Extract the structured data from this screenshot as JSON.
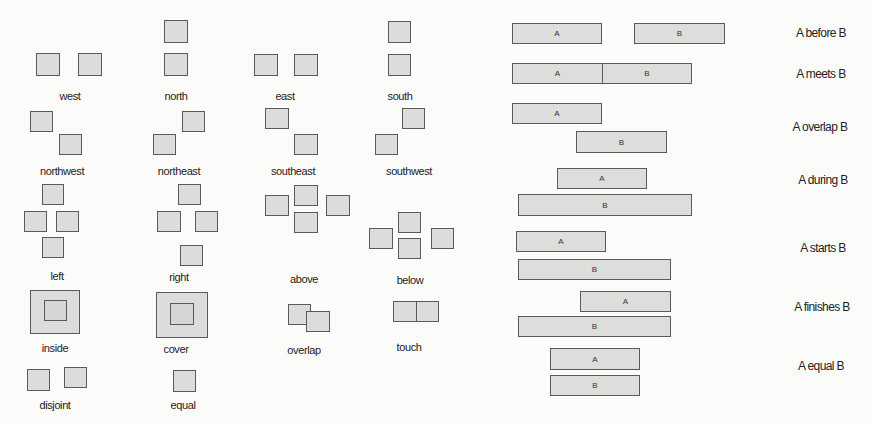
{
  "figure": {
    "spatial_relations": {
      "items": [
        {
          "id": "west",
          "label": "west",
          "label_pos": [
            70,
            96
          ],
          "boxes": [
            [
              36,
              53,
              24,
              23
            ],
            [
              78,
              53,
              24,
              23
            ]
          ]
        },
        {
          "id": "north",
          "label": "north",
          "label_pos": [
            176,
            96
          ],
          "boxes": [
            [
              164,
              20,
              24,
              23
            ],
            [
              164,
              53,
              24,
              23
            ]
          ]
        },
        {
          "id": "east",
          "label": "east",
          "label_pos": [
            285,
            96
          ],
          "boxes": [
            [
              254,
              54,
              24,
              22
            ],
            [
              294,
              54,
              24,
              22
            ]
          ]
        },
        {
          "id": "south",
          "label": "south",
          "label_pos": [
            400,
            96
          ],
          "boxes": [
            [
              388,
              21,
              23,
              22
            ],
            [
              388,
              54,
              23,
              22
            ]
          ]
        },
        {
          "id": "northwest",
          "label": "northwest",
          "label_pos": [
            62,
            171
          ],
          "boxes": [
            [
              30,
              111,
              23,
              21
            ],
            [
              59,
              134,
              23,
              21
            ]
          ]
        },
        {
          "id": "northeast",
          "label": "northeast",
          "label_pos": [
            179,
            171
          ],
          "boxes": [
            [
              182,
              111,
              23,
              21
            ],
            [
              153,
              134,
              23,
              21
            ]
          ]
        },
        {
          "id": "southeast",
          "label": "southeast",
          "label_pos": [
            293,
            171
          ],
          "boxes": [
            [
              265,
              108,
              24,
              21
            ],
            [
              294,
              134,
              24,
              21
            ]
          ]
        },
        {
          "id": "southwest",
          "label": "southwest",
          "label_pos": [
            409,
            171
          ],
          "boxes": [
            [
              402,
              108,
              23,
              21
            ],
            [
              375,
              134,
              23,
              21
            ]
          ]
        },
        {
          "id": "left",
          "label": "left",
          "label_pos": [
            57,
            276
          ],
          "boxes": [
            [
              42,
              184,
              22,
              21
            ],
            [
              24,
              211,
              23,
              21
            ],
            [
              56,
              211,
              23,
              21
            ],
            [
              42,
              237,
              22,
              21
            ]
          ]
        },
        {
          "id": "right",
          "label": "right",
          "label_pos": [
            179,
            277
          ],
          "boxes": [
            [
              178,
              184,
              23,
              21
            ],
            [
              157,
              211,
              24,
              21
            ],
            [
              195,
              211,
              23,
              21
            ],
            [
              180,
              245,
              23,
              21
            ]
          ]
        },
        {
          "id": "above",
          "label": "above",
          "label_pos": [
            304,
            279
          ],
          "boxes": [
            [
              265,
              195,
              24,
              21
            ],
            [
              294,
              185,
              24,
              21
            ],
            [
              326,
              195,
              24,
              21
            ],
            [
              294,
              212,
              24,
              21
            ]
          ]
        },
        {
          "id": "below",
          "label": "below",
          "label_pos": [
            410,
            280
          ],
          "boxes": [
            [
              398,
              212,
              23,
              21
            ],
            [
              369,
              228,
              24,
              21
            ],
            [
              398,
              238,
              23,
              21
            ],
            [
              431,
              228,
              23,
              21
            ]
          ]
        },
        {
          "id": "inside",
          "label": "inside",
          "label_pos": [
            55,
            348
          ],
          "boxes": [
            [
              30,
              290,
              50,
              44
            ]
          ],
          "inner_boxes": [
            [
              44,
              300,
              23,
              21
            ]
          ]
        },
        {
          "id": "cover",
          "label": "cover",
          "label_pos": [
            176,
            349
          ],
          "boxes": [
            [
              156,
              292,
              52,
              46
            ]
          ],
          "inner_boxes": [
            [
              170,
              303,
              24,
              22
            ]
          ]
        },
        {
          "id": "overlap",
          "label": "overlap",
          "label_pos": [
            304,
            350
          ],
          "boxes": [
            [
              288,
              304,
              23,
              21
            ],
            [
              306,
              311,
              24,
              21
            ]
          ]
        },
        {
          "id": "touch",
          "label": "touch",
          "label_pos": [
            409,
            347
          ],
          "boxes": [
            [
              393,
              301,
              24,
              21
            ],
            [
              416,
              301,
              23,
              21
            ]
          ]
        },
        {
          "id": "disjoint",
          "label": "disjoint",
          "label_pos": [
            55,
            405
          ],
          "boxes": [
            [
              27,
              369,
              23,
              22
            ],
            [
              64,
              367,
              23,
              21
            ]
          ]
        },
        {
          "id": "equal",
          "label": "equal",
          "label_pos": [
            183,
            405
          ],
          "boxes": [
            [
              173,
              370,
              23,
              22
            ]
          ]
        }
      ]
    },
    "temporal_relations": {
      "items": [
        {
          "id": "before",
          "label": "A before B",
          "label_pos": [
            821,
            33
          ],
          "bars": [
            {
              "text": "A",
              "rect": [
                512,
                23,
                90,
                21
              ]
            },
            {
              "text": "B",
              "rect": [
                634,
                23,
                91,
                21
              ]
            }
          ]
        },
        {
          "id": "meets",
          "label": "A meets B",
          "label_pos": [
            821,
            74
          ],
          "bars": [
            {
              "text": "A",
              "rect": [
                512,
                63,
                91,
                21
              ]
            },
            {
              "text": "B",
              "rect": [
                602,
                63,
                90,
                21
              ]
            }
          ]
        },
        {
          "id": "overlap",
          "label": "A overlap B",
          "label_pos": [
            820,
            127
          ],
          "bars": [
            {
              "text": "A",
              "rect": [
                512,
                103,
                90,
                21
              ]
            },
            {
              "text": "B",
              "rect": [
                576,
                131,
                91,
                22
              ]
            }
          ]
        },
        {
          "id": "during",
          "label": "A during B",
          "label_pos": [
            823,
            180
          ],
          "bars": [
            {
              "text": "A",
              "rect": [
                557,
                168,
                90,
                21
              ]
            },
            {
              "text": "B",
              "rect": [
                518,
                194,
                174,
                22
              ]
            }
          ]
        },
        {
          "id": "starts",
          "label": "A starts B",
          "label_pos": [
            823,
            248
          ],
          "bars": [
            {
              "text": "A",
              "rect": [
                516,
                231,
                90,
                21
              ]
            },
            {
              "text": "B",
              "rect": [
                518,
                259,
                153,
                21
              ]
            }
          ]
        },
        {
          "id": "finishes",
          "label": "A finishes B",
          "label_pos": [
            822,
            307
          ],
          "bars": [
            {
              "text": "A",
              "rect": [
                580,
                291,
                91,
                21
              ]
            },
            {
              "text": "B",
              "rect": [
                518,
                316,
                153,
                21
              ]
            }
          ]
        },
        {
          "id": "equal",
          "label": "A equal B",
          "label_pos": [
            821,
            366
          ],
          "bars": [
            {
              "text": "A",
              "rect": [
                550,
                348,
                90,
                22
              ]
            },
            {
              "text": "B",
              "rect": [
                550,
                375,
                90,
                21
              ]
            }
          ]
        }
      ]
    },
    "colors": {
      "background": "#fbfbfa",
      "box_fill": "#dcdcdb",
      "box_border": "#5a5a5a",
      "text": "#222222"
    }
  }
}
